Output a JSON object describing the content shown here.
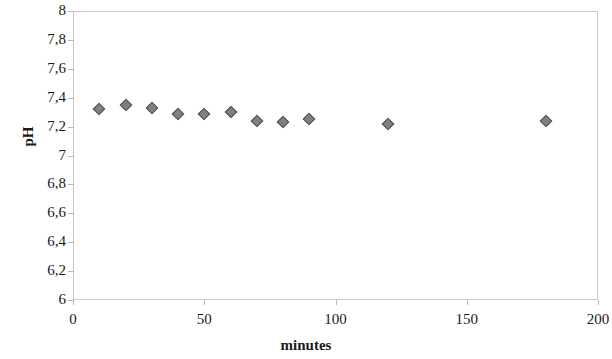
{
  "chart_data": {
    "type": "scatter",
    "title": "",
    "xlabel": "minutes",
    "ylabel": "pH",
    "xlim": [
      0,
      200
    ],
    "ylim": [
      6,
      8
    ],
    "grid": false,
    "legend": null,
    "x_ticks": [
      "0",
      "50",
      "100",
      "150",
      "200"
    ],
    "x_tick_values": [
      0,
      50,
      100,
      150,
      200
    ],
    "y_ticks": [
      "8",
      "7,8",
      "7,6",
      "7,4",
      "7,2",
      "7",
      "6,8",
      "6,6",
      "6,4",
      "6,2",
      "6"
    ],
    "y_tick_values": [
      8,
      7.8,
      7.6,
      7.4,
      7.2,
      7,
      6.8,
      6.6,
      6.4,
      6.2,
      6
    ],
    "decimal_separator": ",",
    "marker": {
      "shape": "diamond",
      "fill": "#808080",
      "edge": "#4f4f4f",
      "size_px": 9
    },
    "frame_color": "#c9c9c9",
    "series": [
      {
        "name": "pH",
        "x": [
          10,
          20,
          30,
          40,
          50,
          60,
          70,
          80,
          90,
          120,
          180
        ],
        "y": [
          7.32,
          7.35,
          7.33,
          7.29,
          7.29,
          7.3,
          7.24,
          7.23,
          7.25,
          7.22,
          7.24
        ]
      }
    ]
  }
}
